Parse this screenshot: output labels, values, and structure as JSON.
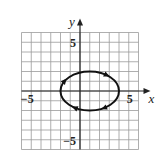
{
  "chart_data": {
    "type": "line",
    "title": "",
    "xlabel": "x",
    "ylabel": "y",
    "xlim": [
      -6,
      6
    ],
    "ylim": [
      -6,
      6
    ],
    "grid": true,
    "grid_step": 1,
    "tick_labels": {
      "x": [
        {
          "value": -5,
          "label": "−5"
        },
        {
          "value": 5,
          "label": "5"
        }
      ],
      "y": [
        {
          "value": 5,
          "label": "5"
        },
        {
          "value": -5,
          "label": "−5"
        }
      ]
    },
    "series": [
      {
        "name": "ellipse",
        "shape": "ellipse",
        "center": [
          1,
          0
        ],
        "semi_axis_x": 3,
        "semi_axis_y": 2,
        "equation": "(x-1)^2/9 + y^2/4 = 1",
        "direction": "clockwise",
        "arrows": [
          {
            "at": "top-right",
            "pointing": "right"
          },
          {
            "at": "upper-left",
            "pointing": "up"
          },
          {
            "at": "lower-left",
            "pointing": "left"
          },
          {
            "at": "lower-right",
            "pointing": "right"
          }
        ]
      }
    ],
    "legend": null
  },
  "colors": {
    "grid": "#9a9a9a",
    "axes": "#222222",
    "curve": "#111111"
  }
}
